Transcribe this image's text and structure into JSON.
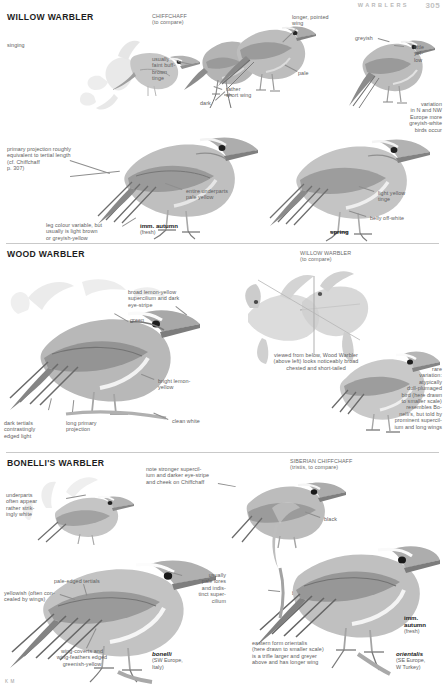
{
  "header": {
    "running_title": "WARBLERS",
    "page_number": "305"
  },
  "signature": "K M",
  "sections": [
    {
      "id": "willow-warbler",
      "title": "WILLOW WARBLER",
      "compare_label": "CHIFFCHAFF\n(to compare)",
      "labels": [
        {
          "name": "singing",
          "text": "singing"
        },
        {
          "name": "usually-faint-buff-brown-tinge",
          "text": "usually\nfaint buff-\nbrown\ntinge"
        },
        {
          "name": "dark",
          "text": "dark"
        },
        {
          "name": "rather-short-wing",
          "text": "rather\nshort wing"
        },
        {
          "name": "longer-pointed-wing",
          "text": "longer, pointed\nwing"
        },
        {
          "name": "pale",
          "text": "pale"
        },
        {
          "name": "greyish",
          "text": "greyish"
        },
        {
          "name": "little-yellow",
          "text": "little\nyel-\nlow"
        },
        {
          "name": "variation-n-nw-europe",
          "text": "variation\nin N and NW\nEurope more\ngreyish-white\nbirds occur"
        },
        {
          "name": "primary-projection",
          "text": "primary projection roughly\nequivalent to tertial length\n(cf. Chiffchaff\np. 307)"
        },
        {
          "name": "entire-underparts-pale-yellow",
          "text": "entire underparts\npale yellow"
        },
        {
          "name": "leg-colour-variable",
          "text": "leg colour variable, but\nusually is light brown\nor greyish-yellow"
        },
        {
          "name": "light-yellow-tinge",
          "text": "light yellow\ntinge"
        },
        {
          "name": "belly-off-white",
          "text": "belly off-white"
        }
      ],
      "age_labels": [
        {
          "name": "imm-autumn",
          "main": "imm. autumn",
          "sub": "(fresh)"
        },
        {
          "name": "spring",
          "main": "spring",
          "sub": ""
        }
      ]
    },
    {
      "id": "wood-warbler",
      "title": "WOOD WARBLER",
      "compare_label": "WILLOW WARBLER\n(to compare)",
      "labels": [
        {
          "name": "broad-lemon-yellow-supercilium",
          "text": "broad lemon-yellow\nsupercilium and dark\neye-stripe"
        },
        {
          "name": "green",
          "text": "green"
        },
        {
          "name": "bright-lemon-yellow",
          "text": "bright lemon-\nyellow"
        },
        {
          "name": "dark-tertials",
          "text": "dark tertials\ncontrastingly\nedged light"
        },
        {
          "name": "long-primary-projection",
          "text": "long primary\nprojection"
        },
        {
          "name": "clean-white",
          "text": "clean white"
        },
        {
          "name": "viewed-from-below",
          "text": "viewed from below, Wood Warbler\n(above left) looks noticeably broad\nchested and short-tailed"
        },
        {
          "name": "rare-variation",
          "text": "rare\nvariation:\natypically\ndull-plumaged\nbird (here drawn\nto smaller scale)\nresembles Bo-\nnelli's, but told by\nprominent supercil-\nium and long wings"
        }
      ],
      "age_labels": []
    },
    {
      "id": "bonellis-warbler",
      "title": "BONELLI'S WARBLER",
      "compare_label": "SIBERIAN CHIFFCHAFF\n(tristis, to compare)",
      "labels": [
        {
          "name": "note-stronger-supercilium",
          "text": "note stronger supercil-\nium and darker eye-stripe\nand cheek on Chiffchaff"
        },
        {
          "name": "underparts-often-appear-striking-white",
          "text": "underparts\noften appear\nrather strik-\ningly white"
        },
        {
          "name": "pale-edged-tertials",
          "text": "pale-edged tertials"
        },
        {
          "name": "yellowish-concealed-by-wings",
          "text": "yellowish (often con-\ncealed by wings)"
        },
        {
          "name": "wing-coverts-and-wing-feathers",
          "text": "wing-coverts and\nwing-feathers edged\ngreenish-yellow"
        },
        {
          "name": "usually-pale-lores",
          "text": "usually\npale lores\nand indis-\ntinct super-\ncilium"
        },
        {
          "name": "black",
          "text": "black"
        },
        {
          "name": "brown",
          "text": "brown"
        },
        {
          "name": "eastern-form-orientalis",
          "text": "eastern form orientalis\n(here drawn to smaller scale)\nis a trifle larger and greyer\nabove and has longer wing"
        }
      ],
      "age_labels": [
        {
          "name": "imm-autumn-bonellis",
          "main": "imm.\nautumn",
          "sub": "(fresh)"
        }
      ],
      "taxa": [
        {
          "name": "bonelli",
          "sci": "bonelli",
          "range": "(SW Europe,\nItaly)"
        },
        {
          "name": "orientalis",
          "sci": "orientalis",
          "range": "(SE Europe,\nW Turkey)"
        }
      ]
    }
  ],
  "colors": {
    "plate_grey_dark": "#7d7d7d",
    "plate_grey_mid": "#a3a3a3",
    "plate_grey_light": "#cfcfcf",
    "plate_pale": "#ececec",
    "rule": "#c9c9c9",
    "leader": "#8e8e8e",
    "label_text": "#5d5d5d",
    "heading_text": "#1c1c1c"
  }
}
